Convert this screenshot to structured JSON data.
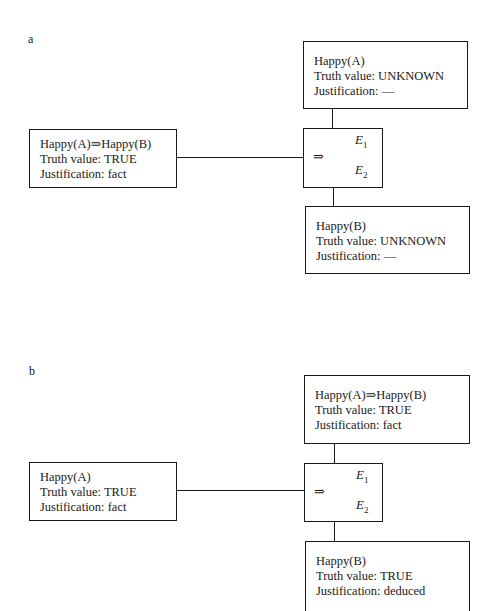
{
  "panels": [
    {
      "label": "a",
      "top_box": {
        "proposition": "Happy(A)",
        "truth_line": "Truth value: UNKNOWN",
        "justification_line": "Justification: —"
      },
      "left_box": {
        "proposition": "Happy(A)⇒Happy(B)",
        "truth_line": "Truth value: TRUE",
        "justification_line": "Justification: fact"
      },
      "node": {
        "operator": "⇒",
        "e1": "E",
        "e1_sub": "1",
        "e2": "E",
        "e2_sub": "2"
      },
      "bottom_box": {
        "proposition": "Happy(B)",
        "truth_line": "Truth value: UNKNOWN",
        "justification_line": "Justification: —"
      }
    },
    {
      "label": "b",
      "top_box": {
        "proposition": "Happy(A)⇒Happy(B)",
        "truth_line": "Truth value: TRUE",
        "justification_line": "Justification: fact"
      },
      "left_box": {
        "proposition": "Happy(A)",
        "truth_line": "Truth value: TRUE",
        "justification_line": "Justification: fact"
      },
      "node": {
        "operator": "⇒",
        "e1": "E",
        "e1_sub": "1",
        "e2": "E",
        "e2_sub": "2"
      },
      "bottom_box": {
        "proposition": "Happy(B)",
        "truth_line": "Truth value: TRUE",
        "justification_line": "Justification: deduced"
      }
    }
  ]
}
